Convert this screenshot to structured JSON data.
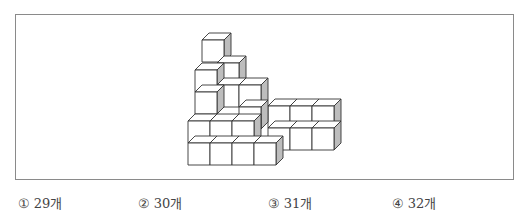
{
  "figure": {
    "cube_size": 22,
    "depth": 7,
    "colors": {
      "face": "#ffffff",
      "side": "#bdbdbd",
      "stroke": "#333333"
    },
    "cubes": [
      {
        "x": 188,
        "y": 143
      },
      {
        "x": 210,
        "y": 143
      },
      {
        "x": 232,
        "y": 143
      },
      {
        "x": 188,
        "y": 121
      },
      {
        "x": 210,
        "y": 121
      },
      {
        "x": 232,
        "y": 121
      },
      {
        "x": 195,
        "y": 92
      },
      {
        "x": 195,
        "y": 70
      },
      {
        "x": 217,
        "y": 85
      },
      {
        "x": 217,
        "y": 63
      },
      {
        "x": 239,
        "y": 107
      },
      {
        "x": 239,
        "y": 85
      },
      {
        "x": 202,
        "y": 40
      },
      {
        "x": 268,
        "y": 128
      },
      {
        "x": 290,
        "y": 128
      },
      {
        "x": 312,
        "y": 128
      },
      {
        "x": 268,
        "y": 106
      },
      {
        "x": 290,
        "y": 106
      },
      {
        "x": 312,
        "y": 106
      },
      {
        "x": 254,
        "y": 143
      }
    ]
  },
  "choices": [
    {
      "num": "①",
      "label": "29개",
      "x": 18
    },
    {
      "num": "②",
      "label": "30개",
      "x": 138
    },
    {
      "num": "③",
      "label": "31개",
      "x": 268
    },
    {
      "num": "④",
      "label": "32개",
      "x": 392
    }
  ]
}
